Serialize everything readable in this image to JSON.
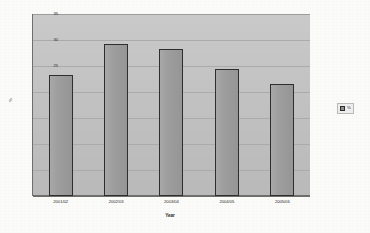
{
  "chart_data": {
    "type": "bar",
    "title": "",
    "subtitle": "",
    "xlabel": "Year",
    "ylabel": "%",
    "categories": [
      "2001/02",
      "2002/03",
      "2003/04",
      "2004/05",
      "2005/06"
    ],
    "values": [
      23.3,
      29.2,
      28.2,
      24.5,
      21.5
    ],
    "series": [
      {
        "name": "%",
        "values": [
          23.3,
          29.2,
          28.2,
          24.5,
          21.5
        ]
      }
    ],
    "ylim": [
      0,
      35
    ],
    "ytick_labels": [
      "0",
      "5",
      "10",
      "15",
      "20",
      "25",
      "30",
      "35"
    ],
    "ytick_values": [
      0,
      5,
      10,
      15,
      20,
      25,
      30,
      35
    ],
    "grid": true,
    "legend": {
      "position": "right",
      "entries": [
        {
          "label": "%",
          "swatch_color": "#8f8f8f"
        }
      ]
    },
    "colors": {
      "plot_background": "#c3c3c3",
      "page_background": "#fbfbfa",
      "bar_fill": "#9a9a9a",
      "bar_outline": "#2e2e2e",
      "gridline": "#ababab",
      "axis": "#6e6e6e",
      "text": "#2b2b2b"
    }
  }
}
